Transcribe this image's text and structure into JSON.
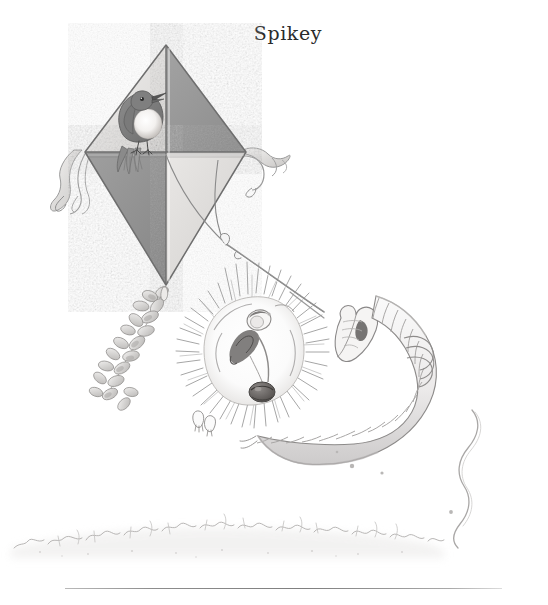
{
  "page": {
    "title": "Spikey",
    "background_color": "#ffffff",
    "width": 548,
    "height": 605,
    "medium": "pencil-and-watercolour-wash children's book illustration",
    "palette": {
      "ink": "#6f6f6f",
      "ink_dark": "#3f3f3f",
      "kite_dark_panel": "#9a9a9a",
      "kite_light_panel": "#e4e4e4",
      "bird_body": "#8b8b8b",
      "bird_breast": "#f2f0ee",
      "hedgehog_quill": "#a6a6a6",
      "nose": "#6a6a6a",
      "grass": "#c9c9c9",
      "rule": "#8d8d8d"
    }
  },
  "illustration": {
    "caption": "A hedgehog flying a diamond kite with a robin perched on the crossbar",
    "elements": [
      {
        "name": "kite",
        "label": "Diamond kite",
        "panels": [
          "top-left light",
          "top-right dark",
          "bottom-left dark",
          "bottom-right light"
        ]
      },
      {
        "name": "bird",
        "label": "Robin perched on kite crossbar"
      },
      {
        "name": "kite-ribbon-left",
        "label": "Left wingtip ribbon streamers"
      },
      {
        "name": "kite-ribbon-right",
        "label": "Right wingtip ribbon streamers"
      },
      {
        "name": "leaf-garland",
        "label": "Leaf garland tail hanging from kite"
      },
      {
        "name": "kite-string",
        "label": "Kite string running to the mitten"
      },
      {
        "name": "hedgehog",
        "label": "Hedgehog with radiating quills"
      },
      {
        "name": "mitten",
        "label": "Mitten holding the kite string"
      },
      {
        "name": "scarf",
        "label": "Long ringed knitted scarf"
      },
      {
        "name": "trailing-string",
        "label": "Loose wavy string trailing to the right"
      },
      {
        "name": "grass",
        "label": "Sketchy grass ground line"
      },
      {
        "name": "divider-rule",
        "label": "Horizontal page divider rule"
      }
    ]
  }
}
